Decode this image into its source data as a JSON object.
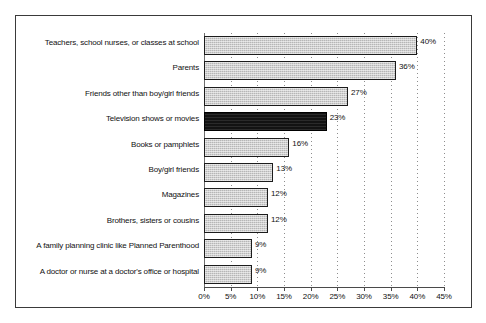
{
  "chart_data": {
    "type": "bar",
    "orientation": "horizontal",
    "title": "",
    "subtitle": "",
    "xlabel": "",
    "ylabel": "",
    "xlim": [
      0,
      45
    ],
    "xtick_step": 5,
    "grid": true,
    "legend": false,
    "categories": [
      "Teachers, school nurses, or classes at school",
      "Parents",
      "Friends other than boy/girl friends",
      "Television shows or movies",
      "Books or pamphlets",
      "Boy/girl friends",
      "Magazines",
      "Brothers, sisters or cousins",
      "A family planning clinic like Planned Parenthood",
      "A doctor or nurse at a doctor's office or hospital"
    ],
    "values": [
      40,
      36,
      27,
      23,
      16,
      13,
      12,
      12,
      9,
      9
    ],
    "data_labels": [
      "40%",
      "36%",
      "27%",
      "23%",
      "16%",
      "13%",
      "12%",
      "12%",
      "9%",
      "9%"
    ],
    "highlight_index": 3,
    "tick_labels": [
      "0%",
      "5%",
      "10%",
      "15%",
      "20%",
      "25%",
      "30%",
      "35%",
      "40%",
      "45%"
    ],
    "tick_values": [
      0,
      5,
      10,
      15,
      20,
      25,
      30,
      35,
      40,
      45
    ],
    "colors": {
      "bar_fill": "#b6b6b6",
      "bar_border": "#1c1c1c",
      "highlight_fill": "#121212",
      "frame": "#3a3a3a",
      "grid": "#8d8d8d",
      "axis": "#4a4a4a",
      "text": "#111111",
      "background": "#ffffff"
    }
  }
}
